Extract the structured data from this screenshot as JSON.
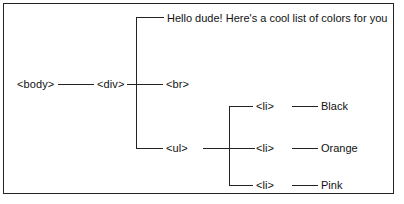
{
  "diagram": {
    "type": "dom-tree",
    "frame": {
      "border_color": "#232323",
      "background": "#ffffff"
    },
    "line_color": "#232323",
    "text_color": "#111111",
    "nodes": {
      "body": "<body>",
      "div": "<div>",
      "br": "<br>",
      "ul": "<ul>",
      "li_black": "<li>",
      "li_orange": "<li>",
      "li_pink": "<li>"
    },
    "text_nodes": {
      "greeting": "Hello dude! Here's a cool list of colors for you"
    },
    "leaves": {
      "black": "Black",
      "orange": "Orange",
      "pink": "Pink"
    }
  }
}
